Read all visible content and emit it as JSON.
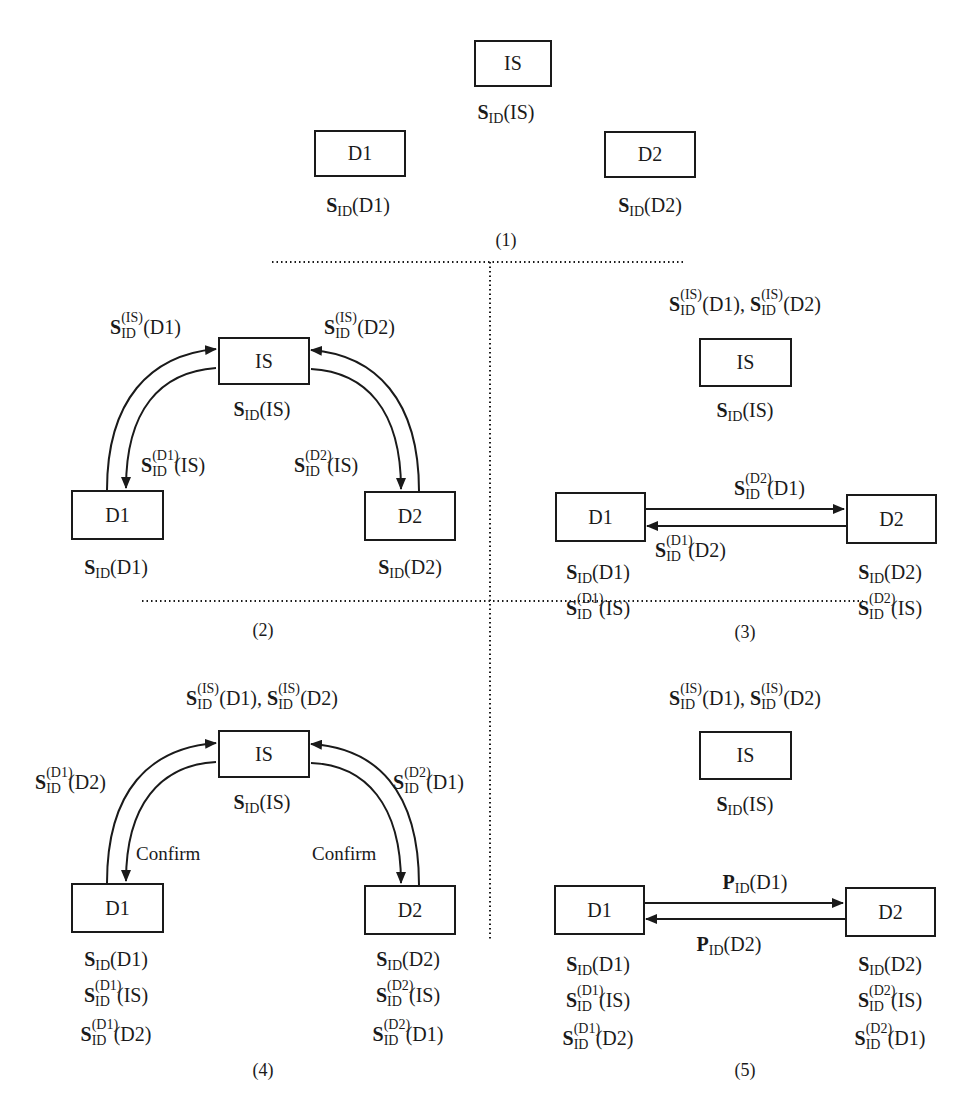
{
  "nodes": {
    "is": "IS",
    "d1": "D1",
    "d2": "D2"
  },
  "panel1": {
    "caption": "(1)",
    "is_label": {
      "sym": "S",
      "sub": "ID",
      "arg": "(IS)"
    },
    "d1_label": {
      "sym": "S",
      "sub": "ID",
      "arg": "(D1)"
    },
    "d2_label": {
      "sym": "S",
      "sub": "ID",
      "arg": "(D2)"
    }
  },
  "panel2": {
    "caption": "(2)",
    "arrow_d1_to_is": {
      "sym": "S",
      "sup": "(IS)",
      "sub": "ID",
      "arg": "(D1)"
    },
    "arrow_d2_to_is": {
      "sym": "S",
      "sup": "(IS)",
      "sub": "ID",
      "arg": "(D2)"
    },
    "arrow_is_to_d1": {
      "sym": "S",
      "sup": "(D1)",
      "sub": "ID",
      "arg": "(IS)"
    },
    "arrow_is_to_d2": {
      "sym": "S",
      "sup": "(D2)",
      "sub": "ID",
      "arg": "(IS)"
    },
    "is_label": {
      "sym": "S",
      "sub": "ID",
      "arg": "(IS)"
    },
    "d1_label": {
      "sym": "S",
      "sub": "ID",
      "arg": "(D1)"
    },
    "d2_label": {
      "sym": "S",
      "sub": "ID",
      "arg": "(D2)"
    }
  },
  "panel3": {
    "caption": "(3)",
    "is_top": {
      "a": {
        "sym": "S",
        "sup": "(IS)",
        "sub": "ID",
        "arg": "(D1),"
      },
      "b": {
        "sym": "S",
        "sup": "(IS)",
        "sub": "ID",
        "arg": "(D2)"
      }
    },
    "is_label": {
      "sym": "S",
      "sub": "ID",
      "arg": "(IS)"
    },
    "arrow_d1_to_d2": {
      "sym": "S",
      "sup": "(D2)",
      "sub": "ID",
      "arg": "(D1)"
    },
    "arrow_d2_to_d1": {
      "sym": "S",
      "sup": "(D1)",
      "sub": "ID",
      "arg": "(D2)"
    },
    "d1_labels": [
      {
        "sym": "S",
        "sup": "",
        "sub": "ID",
        "arg": "(D1)"
      },
      {
        "sym": "S",
        "sup": "(D1)",
        "sub": "ID",
        "arg": "(IS)"
      }
    ],
    "d2_labels": [
      {
        "sym": "S",
        "sup": "",
        "sub": "ID",
        "arg": "(D2)"
      },
      {
        "sym": "S",
        "sup": "(D2)",
        "sub": "ID",
        "arg": "(IS)"
      }
    ]
  },
  "panel4": {
    "caption": "(4)",
    "is_top": {
      "a": {
        "sym": "S",
        "sup": "(IS)",
        "sub": "ID",
        "arg": "(D1),"
      },
      "b": {
        "sym": "S",
        "sup": "(IS)",
        "sub": "ID",
        "arg": "(D2)"
      }
    },
    "is_label": {
      "sym": "S",
      "sub": "ID",
      "arg": "(IS)"
    },
    "arrow_d1_to_is": {
      "sym": "S",
      "sup": "(D1)",
      "sub": "ID",
      "arg": "(D2)"
    },
    "arrow_d2_to_is": {
      "sym": "S",
      "sup": "(D2)",
      "sub": "ID",
      "arg": "(D1)"
    },
    "arrow_is_to_d1": "Confirm",
    "arrow_is_to_d2": "Confirm",
    "d1_labels": [
      {
        "sym": "S",
        "sup": "",
        "sub": "ID",
        "arg": "(D1)"
      },
      {
        "sym": "S",
        "sup": "(D1)",
        "sub": "ID",
        "arg": "(IS)"
      },
      {
        "sym": "S",
        "sup": "(D1)",
        "sub": "ID",
        "arg": "(D2)"
      }
    ],
    "d2_labels": [
      {
        "sym": "S",
        "sup": "",
        "sub": "ID",
        "arg": "(D2)"
      },
      {
        "sym": "S",
        "sup": "(D2)",
        "sub": "ID",
        "arg": "(IS)"
      },
      {
        "sym": "S",
        "sup": "(D2)",
        "sub": "ID",
        "arg": "(D1)"
      }
    ]
  },
  "panel5": {
    "caption": "(5)",
    "is_top": {
      "a": {
        "sym": "S",
        "sup": "(IS)",
        "sub": "ID",
        "arg": "(D1),"
      },
      "b": {
        "sym": "S",
        "sup": "(IS)",
        "sub": "ID",
        "arg": "(D2)"
      }
    },
    "is_label": {
      "sym": "S",
      "sub": "ID",
      "arg": "(IS)"
    },
    "arrow_d1_to_d2": {
      "sym": "P",
      "sub": "ID",
      "arg": "(D1)"
    },
    "arrow_d2_to_d1": {
      "sym": "P",
      "sub": "ID",
      "arg": "(D2)"
    },
    "d1_labels": [
      {
        "sym": "S",
        "sup": "",
        "sub": "ID",
        "arg": "(D1)"
      },
      {
        "sym": "S",
        "sup": "(D1)",
        "sub": "ID",
        "arg": "(IS)"
      },
      {
        "sym": "S",
        "sup": "(D1)",
        "sub": "ID",
        "arg": "(D2)"
      }
    ],
    "d2_labels": [
      {
        "sym": "S",
        "sup": "",
        "sub": "ID",
        "arg": "(D2)"
      },
      {
        "sym": "S",
        "sup": "(D2)",
        "sub": "ID",
        "arg": "(IS)"
      },
      {
        "sym": "S",
        "sup": "(D2)",
        "sub": "ID",
        "arg": "(D1)"
      }
    ]
  },
  "colors": {
    "ink": "#1a1a1a",
    "background": "#ffffff"
  }
}
